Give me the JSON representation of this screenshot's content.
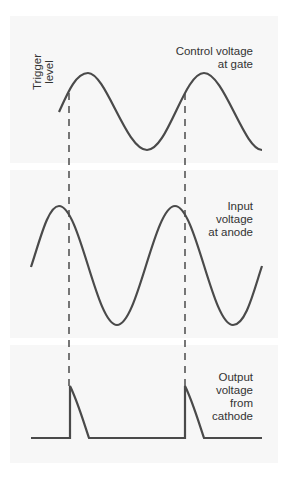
{
  "diagram": {
    "trigger_label": [
      "Trigger",
      "level"
    ],
    "panels": [
      {
        "id": "control",
        "label": [
          "Control voltage",
          "at gate"
        ]
      },
      {
        "id": "input",
        "label": [
          "Input",
          "voltage",
          "at anode"
        ]
      },
      {
        "id": "output",
        "label": [
          "Output",
          "voltage",
          "from",
          "cathode"
        ]
      }
    ],
    "trigger_lines_x": [
      69,
      185
    ],
    "colors": {
      "waveform": "#4a4a4a",
      "dashes": "#555555",
      "panel": "#f7f7f7"
    }
  }
}
